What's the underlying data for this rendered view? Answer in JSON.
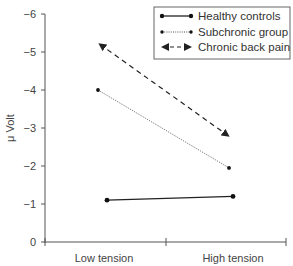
{
  "chart_data": {
    "type": "line",
    "title": "",
    "xlabel": "",
    "ylabel": "μ Volt",
    "categories": [
      "Low tension",
      "High tension"
    ],
    "y_ticks": [
      "0",
      "−1",
      "−2",
      "−3",
      "−4",
      "−5",
      "−6"
    ],
    "y_tick_values": [
      0,
      -1,
      -2,
      -3,
      -4,
      -5,
      -6
    ],
    "ylim": [
      0,
      -6
    ],
    "y_inverted": true,
    "grid": false,
    "legend_position": "top-right",
    "series": [
      {
        "name": "Healthy controls",
        "style": "solid",
        "marker": "dot",
        "values": [
          -1.1,
          -1.2
        ]
      },
      {
        "name": "Subchronic group",
        "style": "dotted",
        "marker": "small-dot",
        "values": [
          -4.0,
          -1.95
        ]
      },
      {
        "name": "Chronic back pain",
        "style": "dashed",
        "marker": "arrow",
        "values": [
          -5.2,
          -2.8
        ]
      }
    ]
  },
  "legend": {
    "items": [
      {
        "label": "Healthy controls"
      },
      {
        "label": "Subchronic group"
      },
      {
        "label": "Chronic back pain"
      }
    ]
  },
  "colors": {
    "line": "#222222",
    "axis": "#555555",
    "text": "#333333"
  }
}
